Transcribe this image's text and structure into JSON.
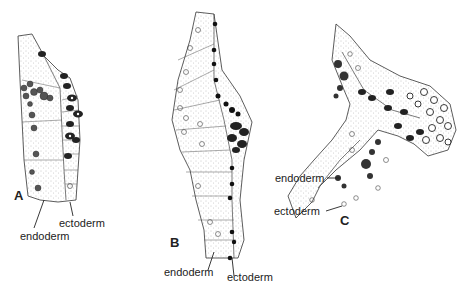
{
  "figure": {
    "panels": [
      {
        "id": "A",
        "letter": "A",
        "labels": {
          "endoderm": "endoderm",
          "ectoderm": "ectoderm"
        }
      },
      {
        "id": "B",
        "letter": "B",
        "labels": {
          "endoderm": "endoderm",
          "ectoderm": "ectoderm"
        }
      },
      {
        "id": "C",
        "letter": "C",
        "labels": {
          "endoderm": "endoderm",
          "ectoderm": "ectoderm"
        }
      }
    ],
    "colors": {
      "background": "#ffffff",
      "ink": "#1a1a1a",
      "stipple": "#9a9a9a"
    }
  }
}
